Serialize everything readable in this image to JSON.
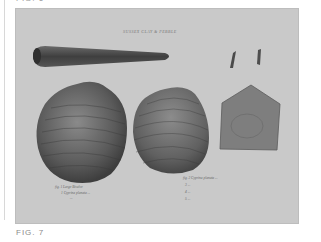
{
  "page": {
    "top_caption": "FIG. 6",
    "bottom_caption": "FIG. 7"
  },
  "plate": {
    "title": "SUSSEX CLAY & PEBBLE",
    "background_color": "#c9c9c9",
    "specimens": [
      {
        "name": "belemnite",
        "label": ""
      },
      {
        "name": "small-teeth",
        "label": ""
      },
      {
        "name": "large-bivalve-left",
        "label": "fig. 1 Large Bivalve"
      },
      {
        "name": "large-bivalve-middle",
        "label": "fig. 2 Cyprina planata"
      },
      {
        "name": "fragment-slab",
        "label": ""
      }
    ],
    "caption_left": {
      "line1": "fig. 1 Large Bivalve",
      "line2": "1 Cyprina planata  ...",
      "line3": "..."
    },
    "caption_right": {
      "line1": "fig. 2 Cyprina planata  ...",
      "line2": "3 ...",
      "line3": "4 ...",
      "line4": "5 ..."
    }
  }
}
